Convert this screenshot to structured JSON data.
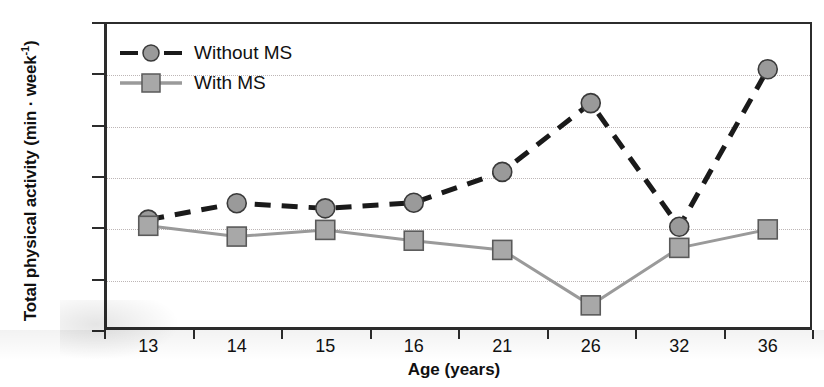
{
  "chart_data": {
    "type": "line",
    "title": "",
    "xlabel": "Age (years)",
    "ylabel": "Total physical activity (min · week⁻¹)",
    "ylabel_main": "Total physical activity (min · week",
    "ylabel_sup": "-1",
    "ylabel_close": ")",
    "categories": [
      "13",
      "14",
      "15",
      "16",
      "21",
      "26",
      "32",
      "36"
    ],
    "x_tick_labels": [
      "13",
      "14",
      "15",
      "16",
      "21",
      "26",
      "32",
      "36"
    ],
    "y_tick_labels": [
      "400",
      "500",
      "600",
      "700",
      "800",
      "900",
      "1000"
    ],
    "y_ticks": [
      400,
      500,
      600,
      700,
      800,
      900,
      1000
    ],
    "ylim": [
      400,
      1000
    ],
    "grid": "horizontal-dotted",
    "legend_position": "top-left-inside",
    "series": [
      {
        "name": "Without MS",
        "marker": "circle",
        "line_style": "dashed",
        "line_color": "#1a1a1a",
        "marker_fill": "#9a9a9a",
        "marker_stroke": "#3a3a3a",
        "values": [
          615,
          647,
          637,
          648,
          708,
          842,
          601,
          908
        ]
      },
      {
        "name": "With MS",
        "marker": "square",
        "line_style": "solid",
        "line_color": "#9a9a9a",
        "marker_fill": "#a8a8a8",
        "marker_stroke": "#5a5a5a",
        "values": [
          603,
          582,
          595,
          574,
          556,
          448,
          560,
          596
        ]
      }
    ]
  },
  "legend": {
    "items": [
      {
        "label": "Without MS",
        "key": "dashed-circle-key"
      },
      {
        "label": "With MS",
        "key": "solid-square-key"
      }
    ]
  },
  "colors": {
    "axis": "#2c2c2c",
    "grid": "#bdb6b6",
    "series_without_ms": "#1a1a1a",
    "series_with_ms": "#9a9a9a",
    "marker_fill": "#9a9a9a",
    "background": "#ffffff",
    "text": "#111111"
  }
}
